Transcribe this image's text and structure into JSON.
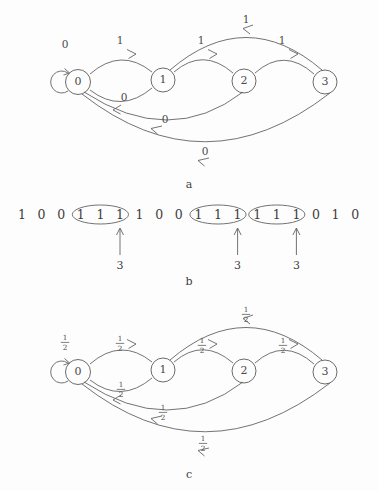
{
  "figure": {
    "background_color": "#fdfdfd",
    "ink_color": "#4a4a4a"
  },
  "panels": [
    {
      "id": "a",
      "caption": "a",
      "type": "state-machine",
      "states": [
        {
          "label": "0",
          "cx": 78,
          "cy": 82
        },
        {
          "label": "1",
          "cx": 163,
          "cy": 80
        },
        {
          "label": "2",
          "cx": 244,
          "cy": 81
        },
        {
          "label": "3",
          "cx": 325,
          "cy": 82
        }
      ],
      "transitions": [
        {
          "from": "0",
          "to": "0",
          "label": "0",
          "kind": "self-loop",
          "label_x": 65,
          "label_y": 51
        },
        {
          "from": "0",
          "to": "1",
          "label": "1",
          "kind": "arc-above",
          "label_x": 120,
          "label_y": 54
        },
        {
          "from": "1",
          "to": "0",
          "label": "0",
          "kind": "arc-below",
          "label_x": 121,
          "label_y": 99
        },
        {
          "from": "1",
          "to": "2",
          "label": "1",
          "kind": "arc-above",
          "label_x": 202,
          "label_y": 55
        },
        {
          "from": "2",
          "to": "3",
          "label": "1",
          "kind": "arc-above",
          "label_x": 283,
          "label_y": 55
        },
        {
          "from": "3",
          "to": "1",
          "label": "1",
          "kind": "arc-far-above",
          "label_x": 246,
          "label_y": 28
        },
        {
          "from": "2",
          "to": "0",
          "label": "0",
          "kind": "arc-far-below",
          "label_x": 163,
          "label_y": 123
        },
        {
          "from": "3",
          "to": "0",
          "label": "0",
          "kind": "arc-far-below",
          "label_x": 203,
          "label_y": 154
        }
      ]
    },
    {
      "id": "b",
      "caption": "b",
      "type": "bit-sequence",
      "bits": [
        "1",
        "0",
        "0",
        "1",
        "1",
        "1",
        "1",
        "0",
        "0",
        "1",
        "1",
        "1",
        "1",
        "1",
        "1",
        "0",
        "1",
        "0"
      ],
      "groups": [
        {
          "start_index": 3,
          "end_index": 5,
          "marker_label": "3"
        },
        {
          "start_index": 9,
          "end_index": 11,
          "marker_label": "3"
        },
        {
          "start_index": 12,
          "end_index": 14,
          "marker_label": "3"
        }
      ]
    },
    {
      "id": "c",
      "caption": "c",
      "type": "state-machine",
      "states": [
        {
          "label": "0",
          "cx": 78,
          "cy": 372
        },
        {
          "label": "1",
          "cx": 163,
          "cy": 370
        },
        {
          "label": "2",
          "cx": 244,
          "cy": 371
        },
        {
          "label": "3",
          "cx": 325,
          "cy": 372
        }
      ],
      "transitions": [
        {
          "from": "0",
          "to": "0",
          "label": "1/2",
          "numerator": "1",
          "denominator": "2",
          "kind": "self-loop",
          "label_x": 65,
          "label_y": 342
        },
        {
          "from": "0",
          "to": "1",
          "label": "1/2",
          "numerator": "1",
          "denominator": "2",
          "kind": "arc-above",
          "label_x": 120,
          "label_y": 343
        },
        {
          "from": "1",
          "to": "0",
          "label": "1/2",
          "numerator": "1",
          "denominator": "2",
          "kind": "arc-below",
          "label_x": 121,
          "label_y": 389
        },
        {
          "from": "1",
          "to": "2",
          "label": "1/2",
          "numerator": "1",
          "denominator": "2",
          "kind": "arc-above",
          "label_x": 202,
          "label_y": 345
        },
        {
          "from": "2",
          "to": "3",
          "label": "1/2",
          "numerator": "1",
          "denominator": "2",
          "kind": "arc-above",
          "label_x": 283,
          "label_y": 345
        },
        {
          "from": "3",
          "to": "1",
          "label": "1/2",
          "numerator": "1",
          "denominator": "2",
          "kind": "arc-far-above",
          "label_x": 246,
          "label_y": 314
        },
        {
          "from": "2",
          "to": "0",
          "label": "1/2",
          "numerator": "1",
          "denominator": "2",
          "kind": "arc-far-below",
          "label_x": 163,
          "label_y": 412
        },
        {
          "from": "3",
          "to": "0",
          "label": "1/2",
          "numerator": "1",
          "denominator": "2",
          "kind": "arc-far-below",
          "label_x": 203,
          "label_y": 443
        }
      ]
    }
  ]
}
